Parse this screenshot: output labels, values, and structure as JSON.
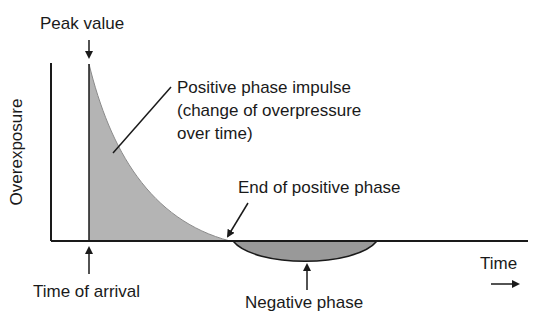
{
  "diagram": {
    "title": "",
    "labels": {
      "peak_value": "Peak value",
      "y_axis": "Overexposure",
      "impulse_line1": "Positive phase impulse",
      "impulse_line2": "(change of overpressure",
      "impulse_line3": "over time)",
      "end_positive": "End of positive phase",
      "time": "Time",
      "time_of_arrival": "Time of arrival",
      "negative_phase": "Negative phase"
    },
    "colors": {
      "line": "#1a1a1a",
      "positive_fill": "#b4b4b4",
      "negative_fill": "#999999",
      "background": "#ffffff"
    }
  }
}
